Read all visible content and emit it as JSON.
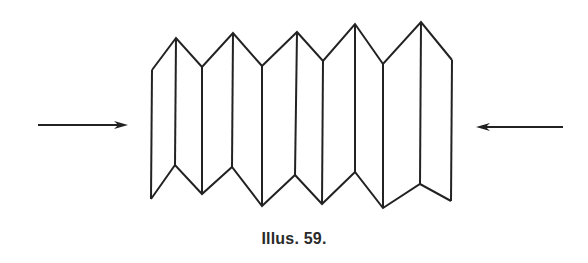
{
  "figure": {
    "caption": "Illus. 59.",
    "stroke_color": "#222222",
    "background_color": "#ffffff",
    "bellows": {
      "top_vertices": [
        [
          152,
          70
        ],
        [
          176,
          38
        ],
        [
          202,
          67
        ],
        [
          233,
          33
        ],
        [
          262,
          66
        ],
        [
          297,
          32
        ],
        [
          323,
          61
        ],
        [
          355,
          24
        ],
        [
          383,
          64
        ],
        [
          421,
          22
        ],
        [
          452,
          60
        ]
      ],
      "bottom_vertices": [
        [
          151,
          199
        ],
        [
          175,
          165
        ],
        [
          202,
          194
        ],
        [
          232,
          167
        ],
        [
          262,
          206
        ],
        [
          295,
          175
        ],
        [
          322,
          204
        ],
        [
          355,
          172
        ],
        [
          383,
          208
        ],
        [
          420,
          184
        ],
        [
          451,
          201
        ]
      ]
    },
    "arrows": [
      {
        "name": "left-arrow",
        "direction": "right",
        "from": [
          38,
          125
        ],
        "to": [
          128,
          125
        ]
      },
      {
        "name": "right-arrow",
        "direction": "left",
        "from": [
          563,
          127
        ],
        "to": [
          476,
          127
        ]
      }
    ]
  }
}
